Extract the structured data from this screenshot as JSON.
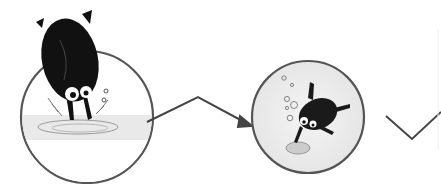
{
  "illustration": {
    "panels": [
      {
        "id": "panel-1",
        "subject": "beetle diving into water",
        "center": [
          87,
          117
        ],
        "radius": 66
      },
      {
        "id": "panel-2",
        "subject": "beetle swimming underwater with bubbles",
        "center": [
          308,
          117
        ],
        "radius": 56
      }
    ],
    "arrows": [
      {
        "id": "arrow-1",
        "from": [
          148,
          121
        ],
        "via": [
          198,
          97
        ],
        "to": [
          252,
          125
        ]
      },
      {
        "id": "arrow-2",
        "from": [
          388,
          116
        ],
        "via": [
          412,
          138
        ],
        "to": [
          441,
          113
        ]
      }
    ],
    "colors": {
      "background": "#ffffff",
      "outline": "#555555",
      "beetle": "#111111",
      "water": "#d9d9d9"
    }
  }
}
